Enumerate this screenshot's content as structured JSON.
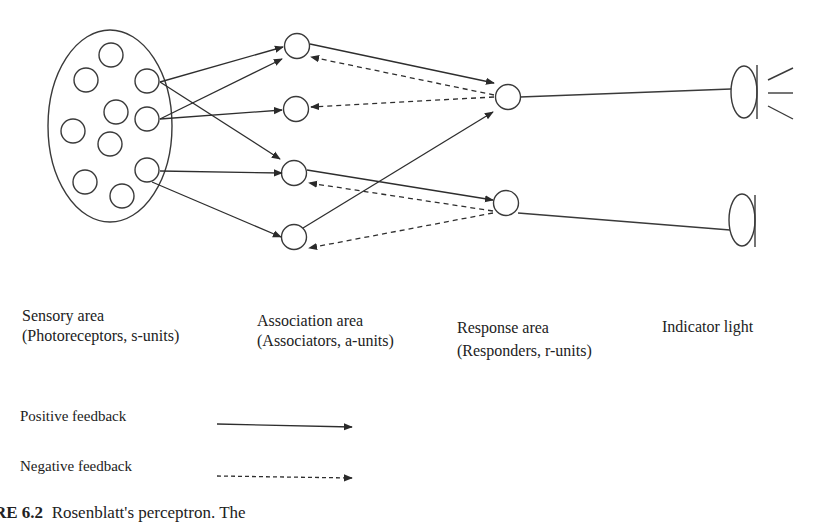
{
  "diagram": {
    "type": "perceptron-architecture",
    "stroke_color": "#3a3a3a",
    "sensory_area": {
      "label": "Sensory area",
      "sublabel": "(Photoreceptors, s-units)",
      "unit_count": 10
    },
    "association_area": {
      "label": "Association area",
      "sublabel": "(Associators, a-units)",
      "unit_count": 4
    },
    "response_area": {
      "label": "Response area",
      "sublabel": "(Responders, r-units)",
      "unit_count": 2
    },
    "indicator": {
      "label": "Indicator light",
      "count": 2,
      "lit": [
        true,
        false
      ]
    },
    "connections": {
      "s_to_a": [
        {
          "from": "s-upper",
          "to": "a1",
          "type": "positive"
        },
        {
          "from": "s-upper",
          "to": "a3",
          "type": "positive"
        },
        {
          "from": "s-middle",
          "to": "a1",
          "type": "positive"
        },
        {
          "from": "s-middle",
          "to": "a2",
          "type": "positive"
        },
        {
          "from": "s-lower",
          "to": "a3",
          "type": "positive"
        },
        {
          "from": "s-lower",
          "to": "a4",
          "type": "positive"
        }
      ],
      "a_to_r": [
        {
          "from": "a1",
          "to": "r1",
          "type": "positive"
        },
        {
          "from": "a4",
          "to": "r1",
          "type": "positive"
        },
        {
          "from": "a3",
          "to": "r2",
          "type": "positive"
        }
      ],
      "r_to_a": [
        {
          "from": "r1",
          "to": "a1",
          "type": "negative"
        },
        {
          "from": "r1",
          "to": "a2",
          "type": "negative"
        },
        {
          "from": "r2",
          "to": "a3",
          "type": "negative"
        },
        {
          "from": "r2",
          "to": "a4",
          "type": "negative"
        }
      ],
      "r_to_light": [
        {
          "from": "r1",
          "to": "light1"
        },
        {
          "from": "r2",
          "to": "light2"
        }
      ]
    }
  },
  "legend": {
    "positive": "Positive feedback",
    "negative": "Negative feedback"
  },
  "caption": {
    "number": "RE 6.2",
    "text": "Rosenblatt's perceptron. The"
  }
}
